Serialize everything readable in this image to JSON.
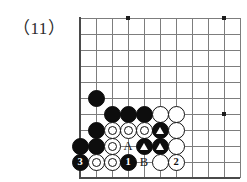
{
  "figure": {
    "label": "（11）",
    "kind": "go-board-problem-diagram"
  },
  "colors": {
    "black_stone": "#0d0d0d",
    "white_stone": "#ffffff",
    "stone_outline": "#121212",
    "grid_line": "#7d7d7d",
    "border_line": "#4a4a4a",
    "text": "#2b2b2b",
    "page_background": "#ffffff"
  },
  "board": {
    "origin_x": 80,
    "origin_y": 18,
    "spacing": 16,
    "cols": 10,
    "rows": 10,
    "edges": {
      "left": true,
      "bottom": true,
      "top": false,
      "right": false
    },
    "star_points": [
      {
        "col": 3,
        "row": 0
      },
      {
        "col": 9,
        "row": 0
      },
      {
        "col": 9,
        "row": 6
      }
    ]
  },
  "stones": [
    {
      "name": "black-stone",
      "color": "black",
      "col": 1,
      "row": 5,
      "label": "",
      "marker": "none"
    },
    {
      "name": "black-stone",
      "color": "black",
      "col": 2,
      "row": 6,
      "label": "",
      "marker": "none"
    },
    {
      "name": "black-stone",
      "color": "black",
      "col": 3,
      "row": 6,
      "label": "",
      "marker": "none"
    },
    {
      "name": "black-stone",
      "color": "black",
      "col": 4,
      "row": 6,
      "label": "",
      "marker": "none"
    },
    {
      "name": "white-stone",
      "color": "white",
      "col": 5,
      "row": 6,
      "label": "",
      "marker": "none",
      "plain": true
    },
    {
      "name": "white-stone",
      "color": "white",
      "col": 6,
      "row": 6,
      "label": "",
      "marker": "none",
      "plain": true
    },
    {
      "name": "black-stone",
      "color": "black",
      "col": 1,
      "row": 7,
      "label": "",
      "marker": "none"
    },
    {
      "name": "white-stone",
      "color": "white",
      "col": 2,
      "row": 7,
      "label": "",
      "marker": "none"
    },
    {
      "name": "white-stone",
      "color": "white",
      "col": 3,
      "row": 7,
      "label": "",
      "marker": "none"
    },
    {
      "name": "white-stone",
      "color": "white",
      "col": 4,
      "row": 7,
      "label": "",
      "marker": "none"
    },
    {
      "name": "black-stone-triangle",
      "color": "black",
      "col": 5,
      "row": 7,
      "label": "",
      "marker": "triangle"
    },
    {
      "name": "white-stone",
      "color": "white",
      "col": 6,
      "row": 7,
      "label": "",
      "marker": "none",
      "plain": true
    },
    {
      "name": "black-stone",
      "color": "black",
      "col": 0,
      "row": 8,
      "label": "",
      "marker": "none"
    },
    {
      "name": "black-stone",
      "color": "black",
      "col": 1,
      "row": 8,
      "label": "",
      "marker": "none"
    },
    {
      "name": "white-stone",
      "color": "white",
      "col": 2,
      "row": 8,
      "label": "",
      "marker": "none"
    },
    {
      "name": "black-stone-triangle",
      "color": "black",
      "col": 4,
      "row": 8,
      "label": "",
      "marker": "triangle"
    },
    {
      "name": "black-stone-triangle",
      "color": "black",
      "col": 5,
      "row": 8,
      "label": "",
      "marker": "triangle"
    },
    {
      "name": "white-stone",
      "color": "white",
      "col": 6,
      "row": 8,
      "label": "",
      "marker": "none",
      "plain": true
    },
    {
      "name": "black-stone-move-3",
      "color": "black",
      "col": 0,
      "row": 9,
      "label": "3",
      "marker": "none"
    },
    {
      "name": "white-stone",
      "color": "white",
      "col": 1,
      "row": 9,
      "label": "",
      "marker": "none"
    },
    {
      "name": "white-stone",
      "color": "white",
      "col": 2,
      "row": 9,
      "label": "",
      "marker": "none"
    },
    {
      "name": "black-stone-move-1",
      "color": "black",
      "col": 3,
      "row": 9,
      "label": "1",
      "marker": "none"
    },
    {
      "name": "white-stone",
      "color": "white",
      "col": 5,
      "row": 9,
      "label": "",
      "marker": "none",
      "plain": true
    },
    {
      "name": "white-stone-move-2",
      "color": "white",
      "col": 6,
      "row": 9,
      "label": "2",
      "marker": "none",
      "plain": true
    }
  ],
  "letters": [
    {
      "name": "point-label-A",
      "text": "A",
      "col": 3,
      "row": 8
    },
    {
      "name": "point-label-B",
      "text": "B",
      "col": 4,
      "row": 9
    }
  ]
}
